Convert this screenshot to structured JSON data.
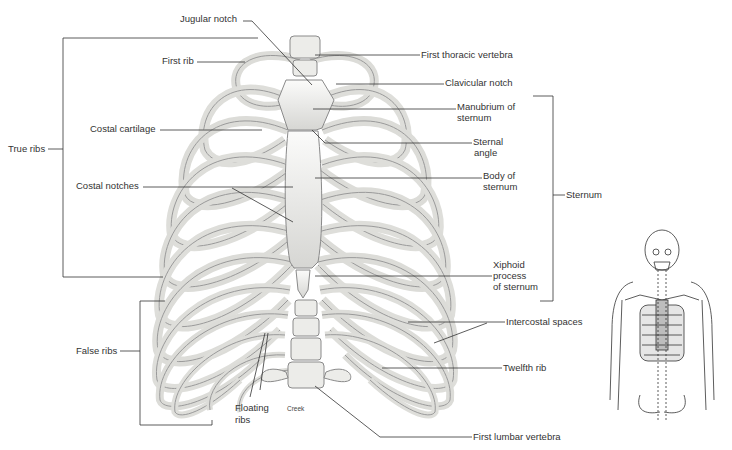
{
  "diagram": {
    "labels": {
      "jugular_notch": "Jugular notch",
      "first_rib": "First rib",
      "first_thoracic_vertebra": "First thoracic vertebra",
      "clavicular_notch": "Clavicular notch",
      "manubrium_line1": "Manubrium of",
      "manubrium_line2": "sternum",
      "costal_cartilage": "Costal cartilage",
      "sternal_angle_line1": "Sternal",
      "sternal_angle_line2": "angle",
      "true_ribs": "True ribs",
      "costal_notches": "Costal notches",
      "body_line1": "Body of",
      "body_line2": "sternum",
      "sternum": "Sternum",
      "xiphoid_line1": "Xiphoid",
      "xiphoid_line2": "process",
      "xiphoid_line3": "of sternum",
      "intercostal_spaces": "Intercostal spaces",
      "false_ribs": "False ribs",
      "twelfth_rib": "Twelfth rib",
      "floating_line1": "Floating",
      "floating_line2": "ribs",
      "credit": "Creek",
      "first_lumbar_vertebra": "First lumbar vertebra"
    },
    "brackets": {
      "true_ribs": {
        "x": 63,
        "y_top": 38,
        "y_bottom": 277
      },
      "false_ribs": {
        "x": 140,
        "y_top": 301,
        "y_bottom": 425
      },
      "sternum": {
        "x": 553,
        "y_top": 96,
        "y_bottom": 301
      }
    },
    "colors": {
      "bone_fill": "#f2f2f0",
      "bone_stroke": "#8a8a8a",
      "shade": "#c9c9c6",
      "leader_line": "#333333",
      "thumbnail_highlight": "#bdbdbd"
    },
    "inset": {
      "description": "Full skeleton upper body with highlighted thoracic cage"
    }
  }
}
